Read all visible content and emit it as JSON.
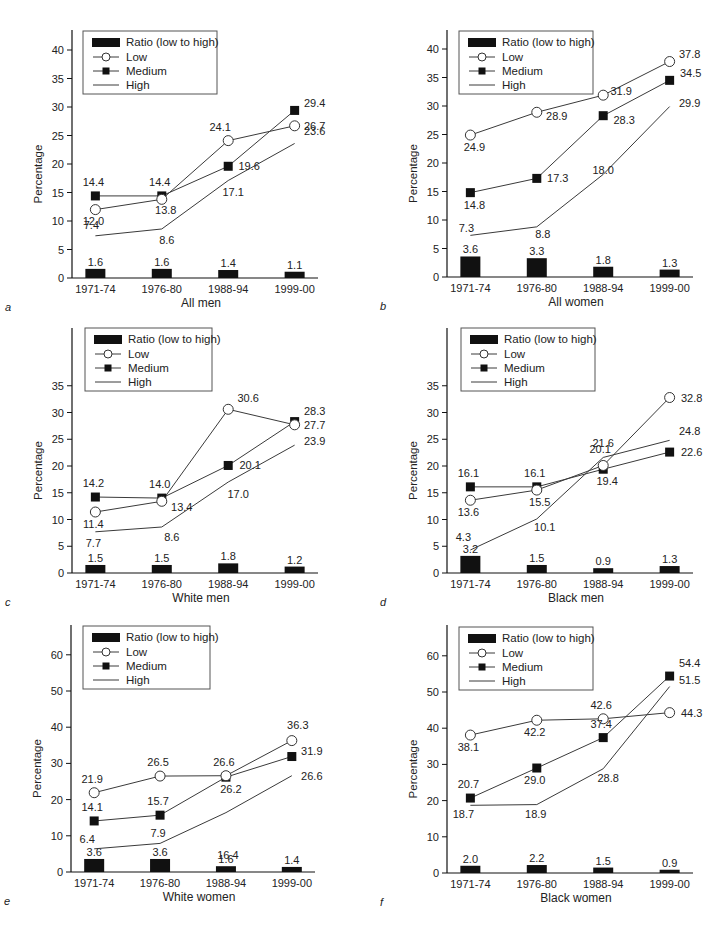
{
  "chart_data": [
    {
      "panel": "a",
      "type": "line",
      "title": "All men",
      "xlabel": "All men",
      "ylabel": "Percentage",
      "categories": [
        "1971-74",
        "1976-80",
        "1988-94",
        "1999-00"
      ],
      "yticks": [
        0,
        5,
        10,
        15,
        20,
        25,
        30,
        35,
        40
      ],
      "ylim": [
        0,
        42.5
      ],
      "grid": false,
      "legend": {
        "position": "upper left",
        "entries": [
          "Ratio (low to high)",
          "Low",
          "Medium",
          "High"
        ]
      },
      "series": [
        {
          "name": "Ratio (low to high)",
          "type": "bar",
          "values": [
            1.6,
            1.6,
            1.4,
            1.1
          ]
        },
        {
          "name": "Low",
          "marker": "open-circle",
          "values": [
            12.0,
            13.8,
            24.1,
            26.7
          ]
        },
        {
          "name": "Medium",
          "marker": "filled-square",
          "values": [
            14.4,
            14.4,
            19.6,
            29.4
          ]
        },
        {
          "name": "High",
          "marker": "none",
          "values": [
            7.4,
            8.6,
            17.1,
            23.6
          ]
        }
      ]
    },
    {
      "panel": "b",
      "type": "line",
      "title": "All women",
      "xlabel": "All women",
      "ylabel": "Percentage",
      "categories": [
        "1971-74",
        "1976-80",
        "1988-94",
        "1999-00"
      ],
      "yticks": [
        0,
        5,
        10,
        15,
        20,
        25,
        30,
        35,
        40
      ],
      "ylim": [
        0,
        42.5
      ],
      "grid": false,
      "legend": {
        "position": "upper left",
        "entries": [
          "Ratio (low to high)",
          "Low",
          "Medium",
          "High"
        ]
      },
      "series": [
        {
          "name": "Ratio (low to high)",
          "type": "bar",
          "values": [
            3.6,
            3.3,
            1.8,
            1.3
          ]
        },
        {
          "name": "Low",
          "marker": "open-circle",
          "values": [
            24.9,
            28.9,
            31.9,
            37.8
          ]
        },
        {
          "name": "Medium",
          "marker": "filled-square",
          "values": [
            14.8,
            17.3,
            28.3,
            34.5
          ]
        },
        {
          "name": "High",
          "marker": "none",
          "values": [
            7.3,
            8.8,
            18.0,
            29.9
          ]
        }
      ]
    },
    {
      "panel": "c",
      "type": "line",
      "title": "White men",
      "xlabel": "White men",
      "ylabel": "Percentage",
      "categories": [
        "1971-74",
        "1976-80",
        "1988-94",
        "1999-00"
      ],
      "yticks": [
        0,
        5,
        10,
        15,
        20,
        25,
        30,
        35
      ],
      "ylim": [
        0,
        45.5
      ],
      "grid": false,
      "legend": {
        "position": "upper left",
        "entries": [
          "Ratio (low to high)",
          "Low",
          "Medium",
          "High"
        ]
      },
      "series": [
        {
          "name": "Ratio (low to high)",
          "type": "bar",
          "values": [
            1.5,
            1.5,
            1.8,
            1.2
          ]
        },
        {
          "name": "Low",
          "marker": "open-circle",
          "values": [
            11.4,
            13.4,
            30.6,
            27.7
          ]
        },
        {
          "name": "Medium",
          "marker": "filled-square",
          "values": [
            14.2,
            14.0,
            20.1,
            28.3
          ]
        },
        {
          "name": "High",
          "marker": "none",
          "values": [
            7.7,
            8.6,
            17.0,
            23.9
          ]
        }
      ]
    },
    {
      "panel": "d",
      "type": "line",
      "title": "Black men",
      "xlabel": "Black men",
      "ylabel": "Percentage",
      "categories": [
        "1971-74",
        "1976-80",
        "1988-94",
        "1999-00"
      ],
      "yticks": [
        0,
        5,
        10,
        15,
        20,
        25,
        30,
        35
      ],
      "ylim": [
        0,
        45.5
      ],
      "grid": false,
      "legend": {
        "position": "upper left",
        "entries": [
          "Ratio (low to high)",
          "Low",
          "Medium",
          "High"
        ]
      },
      "series": [
        {
          "name": "Ratio (low to high)",
          "type": "bar",
          "values": [
            3.2,
            1.5,
            0.9,
            1.3
          ]
        },
        {
          "name": "Low",
          "marker": "open-circle",
          "values": [
            13.6,
            15.5,
            20.1,
            32.8
          ]
        },
        {
          "name": "Medium",
          "marker": "filled-square",
          "values": [
            16.1,
            16.1,
            19.4,
            22.6
          ]
        },
        {
          "name": "High",
          "marker": "none",
          "values": [
            4.3,
            10.1,
            21.6,
            24.8
          ]
        }
      ]
    },
    {
      "panel": "e",
      "type": "line",
      "title": "White women",
      "xlabel": "White women",
      "ylabel": "Percentage",
      "categories": [
        "1971-74",
        "1976-80",
        "1988-94",
        "1999-00"
      ],
      "yticks": [
        0,
        10,
        20,
        30,
        40,
        50,
        60
      ],
      "ylim": [
        0,
        68
      ],
      "grid": false,
      "legend": {
        "position": "upper left",
        "entries": [
          "Ratio (low to high)",
          "Low",
          "Medium",
          "High"
        ]
      },
      "series": [
        {
          "name": "Ratio (low to high)",
          "type": "bar",
          "values": [
            3.6,
            3.6,
            1.6,
            1.4
          ]
        },
        {
          "name": "Low",
          "marker": "open-circle",
          "values": [
            21.9,
            26.5,
            26.6,
            36.3
          ]
        },
        {
          "name": "Medium",
          "marker": "filled-square",
          "values": [
            14.1,
            15.7,
            26.2,
            31.9
          ]
        },
        {
          "name": "High",
          "marker": "none",
          "values": [
            6.4,
            7.9,
            16.4,
            26.6
          ]
        }
      ]
    },
    {
      "panel": "f",
      "type": "line",
      "title": "Black women",
      "xlabel": "Black women",
      "ylabel": "Percentage",
      "categories": [
        "1971-74",
        "1976-80",
        "1988-94",
        "1999-00"
      ],
      "yticks": [
        0,
        10,
        20,
        30,
        40,
        50,
        60
      ],
      "ylim": [
        0,
        68
      ],
      "grid": false,
      "legend": {
        "position": "upper left",
        "entries": [
          "Ratio (low to high)",
          "Low",
          "Medium",
          "High"
        ]
      },
      "series": [
        {
          "name": "Ratio (low to high)",
          "type": "bar",
          "values": [
            2.0,
            2.2,
            1.5,
            0.9
          ]
        },
        {
          "name": "Low",
          "marker": "open-circle",
          "values": [
            38.1,
            42.2,
            42.6,
            44.3
          ]
        },
        {
          "name": "Medium",
          "marker": "filled-square",
          "values": [
            20.7,
            29.0,
            37.4,
            54.4
          ]
        },
        {
          "name": "High",
          "marker": "none",
          "values": [
            18.7,
            18.9,
            28.8,
            51.5
          ]
        }
      ]
    }
  ],
  "colors": {
    "ink": "#111111",
    "line": "#3a3a3a",
    "background": "#ffffff"
  }
}
